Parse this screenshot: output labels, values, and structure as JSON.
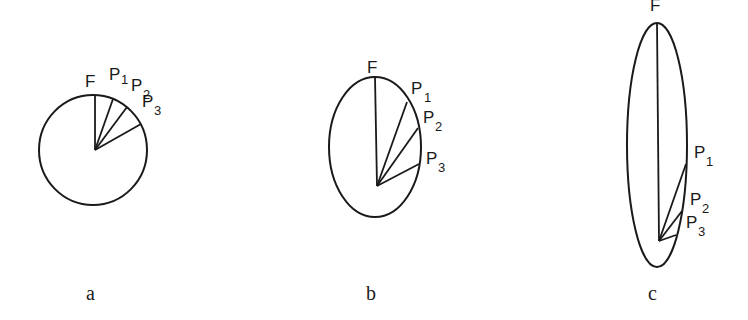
{
  "figure": {
    "panels": [
      {
        "caption": "a",
        "shape": "circle",
        "labels": {
          "F": "F",
          "P1": "P",
          "P1_sub": "1",
          "P2": "P",
          "P2_sub": "2",
          "P3": "P",
          "P3_sub": "3"
        }
      },
      {
        "caption": "b",
        "shape": "ellipse",
        "labels": {
          "F": "F",
          "P1": "P",
          "P1_sub": "1",
          "P2": "P",
          "P2_sub": "2",
          "P3": "P",
          "P3_sub": "3"
        }
      },
      {
        "caption": "c",
        "shape": "ellipse",
        "labels": {
          "F": "F",
          "P1": "P",
          "P1_sub": "1",
          "P2": "P",
          "P2_sub": "2",
          "P3": "P",
          "P3_sub": "3"
        }
      }
    ],
    "line_color": "#1a1a1a",
    "background": "#ffffff"
  }
}
